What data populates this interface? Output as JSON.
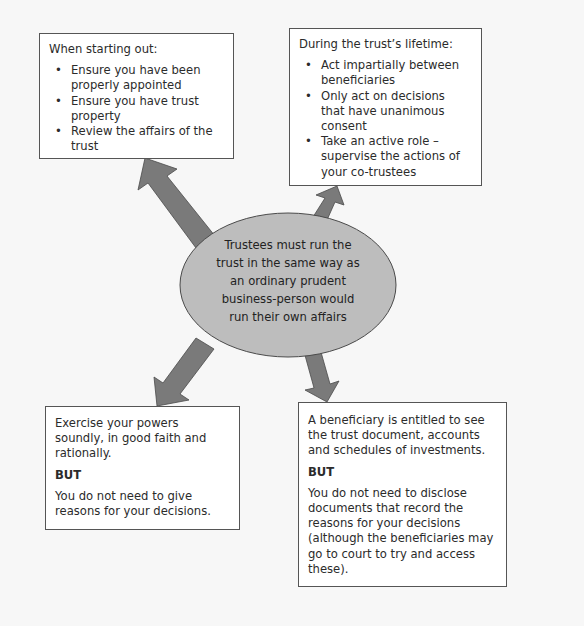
{
  "diagram": {
    "type": "hub-and-spoke",
    "colors": {
      "background": "#f7f7f7",
      "box_fill": "#ffffff",
      "box_border": "#555555",
      "ellipse_fill": "#bdbdbd",
      "arrow_fill": "#7a7a7a",
      "text": "#2b2b2b"
    },
    "center": {
      "text_lines": [
        "Trustees must run the",
        "trust in the same way as",
        "an ordinary prudent",
        "business-person would",
        "run their own affairs"
      ]
    },
    "top_left": {
      "heading": "When starting out:",
      "bullets": [
        "Ensure you have been properly appointed",
        "Ensure you have trust property",
        "Review the affairs of the trust"
      ]
    },
    "top_right": {
      "heading": "During the trust’s lifetime:",
      "bullets": [
        "Act impartially between beneficiaries",
        "Only act on decisions that have unanimous consent",
        "Take an active role – supervise the actions of your co-trustees"
      ]
    },
    "bottom_left": {
      "text": "Exercise your powers soundly, in good faith and rationally.",
      "but_label": "BUT",
      "but_text": "You do not need to give reasons for your decisions."
    },
    "bottom_right": {
      "text": "A beneficiary is entitled to see the trust document, accounts and schedules of investments.",
      "but_label": "BUT",
      "but_text": "You do not need to disclose documents that record the reasons for your decisions (although the beneficiaries may go to court to try and access these)."
    },
    "arrows": [
      {
        "from": "center",
        "to": "top_left",
        "icon": "arrow-up-left-icon"
      },
      {
        "from": "center",
        "to": "top_right",
        "icon": "arrow-up-right-icon"
      },
      {
        "from": "center",
        "to": "bottom_left",
        "icon": "arrow-down-left-icon"
      },
      {
        "from": "center",
        "to": "bottom_right",
        "icon": "arrow-down-right-icon"
      }
    ]
  }
}
